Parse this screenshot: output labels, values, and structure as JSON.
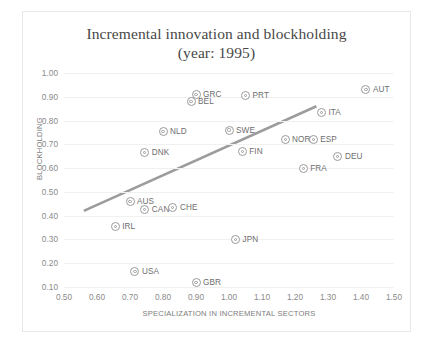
{
  "chart_data": {
    "type": "scatter",
    "title": "Incremental innovation and blockholding (year: 1995)",
    "title_line1": "Incremental innovation and blockholding",
    "title_line2": "(year: 1995)",
    "xlabel": "SPECIALIZATION IN INCREMENTAL SECTORS",
    "ylabel": "BLOCKHOLDING",
    "xlim": [
      0.5,
      1.5
    ],
    "ylim": [
      0.1,
      1.0
    ],
    "xticks": [
      "0.50",
      "0.60",
      "0.70",
      "0.80",
      "0.90",
      "1.00",
      "1.10",
      "1.20",
      "1.30",
      "1.40",
      "1.50"
    ],
    "yticks": [
      "0.10",
      "0.20",
      "0.30",
      "0.40",
      "0.50",
      "0.60",
      "0.70",
      "0.80",
      "0.90",
      "1.00"
    ],
    "grid": true,
    "legend": "none",
    "marker_color": "#9a9a9a",
    "trendline_color": "#9c9c9c",
    "points": [
      {
        "label": "IRL",
        "x": 0.655,
        "y": 0.355
      },
      {
        "label": "USA",
        "x": 0.715,
        "y": 0.165
      },
      {
        "label": "AUS",
        "x": 0.7,
        "y": 0.46
      },
      {
        "label": "CAN",
        "x": 0.745,
        "y": 0.425
      },
      {
        "label": "DNK",
        "x": 0.745,
        "y": 0.665
      },
      {
        "label": "CHE",
        "x": 0.83,
        "y": 0.435
      },
      {
        "label": "NLD",
        "x": 0.8,
        "y": 0.755
      },
      {
        "label": "BEL",
        "x": 0.885,
        "y": 0.88
      },
      {
        "label": "GRC",
        "x": 0.9,
        "y": 0.91
      },
      {
        "label": "GBR",
        "x": 0.9,
        "y": 0.12
      },
      {
        "label": "SWE",
        "x": 1.0,
        "y": 0.76
      },
      {
        "label": "JPN",
        "x": 1.02,
        "y": 0.3
      },
      {
        "label": "PRT",
        "x": 1.05,
        "y": 0.905
      },
      {
        "label": "FIN",
        "x": 1.04,
        "y": 0.67
      },
      {
        "label": "NOR",
        "x": 1.17,
        "y": 0.72
      },
      {
        "label": "FRA",
        "x": 1.225,
        "y": 0.6
      },
      {
        "label": "ESP",
        "x": 1.255,
        "y": 0.72
      },
      {
        "label": "ITA",
        "x": 1.28,
        "y": 0.835
      },
      {
        "label": "DEU",
        "x": 1.33,
        "y": 0.65
      },
      {
        "label": "AUT",
        "x": 1.415,
        "y": 0.93
      }
    ],
    "trendline": {
      "x1": 0.56,
      "y1": 0.42,
      "x2": 1.265,
      "y2": 0.86
    }
  }
}
